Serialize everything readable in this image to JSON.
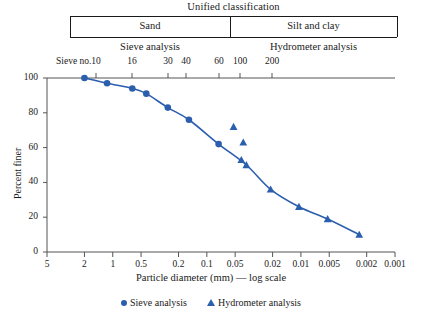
{
  "classification": {
    "title": "Unified classification",
    "groups": [
      {
        "label": "Sand"
      },
      {
        "label": "Silt and clay"
      }
    ],
    "methods": [
      {
        "label": "Sieve analysis"
      },
      {
        "label": "Hydrometer analysis"
      }
    ]
  },
  "sieve_row": {
    "prefix": "Sieve no.",
    "numbers": [
      "10",
      "16",
      "30",
      "40",
      "60",
      "100",
      "200"
    ]
  },
  "legend": {
    "items": [
      {
        "label": "Sieve analysis",
        "marker": "circle-marker",
        "color": "#2b5fad"
      },
      {
        "label": "Hydrometer analysis",
        "marker": "triangle-marker",
        "color": "#2b5fad"
      }
    ]
  },
  "chart_data": {
    "type": "line",
    "title": "",
    "xlabel": "Particle diameter (mm) — log scale",
    "ylabel": "Percent finer",
    "xscale": "log",
    "xlim": [
      5,
      0.001
    ],
    "ylim": [
      0,
      100
    ],
    "grid": false,
    "legend_position": "bottom-center",
    "xticks": [
      "5",
      "2",
      "1",
      "0.5",
      "0.2",
      "0.1",
      "0.05",
      "0.02",
      "0.01",
      "0.005",
      "0.002",
      "0.001"
    ],
    "xtick_values": [
      5,
      2,
      1,
      0.5,
      0.2,
      0.1,
      0.05,
      0.02,
      0.01,
      0.005,
      0.002,
      0.001
    ],
    "yticks": [
      "0",
      "20",
      "40",
      "60",
      "80",
      "100"
    ],
    "ytick_values": [
      0,
      20,
      40,
      60,
      80,
      100
    ],
    "series": [
      {
        "name": "Sieve analysis",
        "marker": "circle",
        "color": "#2b5fad",
        "points": [
          {
            "x": 2.0,
            "y": 100
          },
          {
            "x": 1.15,
            "y": 97
          },
          {
            "x": 0.62,
            "y": 94
          },
          {
            "x": 0.44,
            "y": 91
          },
          {
            "x": 0.26,
            "y": 83
          },
          {
            "x": 0.155,
            "y": 76
          },
          {
            "x": 0.075,
            "y": 62
          }
        ]
      },
      {
        "name": "Hydrometer analysis",
        "marker": "triangle",
        "color": "#2b5fad",
        "points": [
          {
            "x": 0.052,
            "y": 72
          },
          {
            "x": 0.041,
            "y": 63
          },
          {
            "x": 0.043,
            "y": 53
          },
          {
            "x": 0.038,
            "y": 50
          },
          {
            "x": 0.021,
            "y": 36
          },
          {
            "x": 0.0105,
            "y": 26
          },
          {
            "x": 0.0052,
            "y": 19
          },
          {
            "x": 0.0024,
            "y": 10
          }
        ]
      }
    ],
    "curve": [
      {
        "x": 2.0,
        "y": 100
      },
      {
        "x": 1.15,
        "y": 97
      },
      {
        "x": 0.62,
        "y": 94
      },
      {
        "x": 0.44,
        "y": 91
      },
      {
        "x": 0.26,
        "y": 83
      },
      {
        "x": 0.155,
        "y": 76
      },
      {
        "x": 0.075,
        "y": 62
      },
      {
        "x": 0.038,
        "y": 50
      },
      {
        "x": 0.021,
        "y": 36
      },
      {
        "x": 0.0105,
        "y": 26
      },
      {
        "x": 0.0052,
        "y": 19
      },
      {
        "x": 0.0024,
        "y": 10
      }
    ]
  }
}
